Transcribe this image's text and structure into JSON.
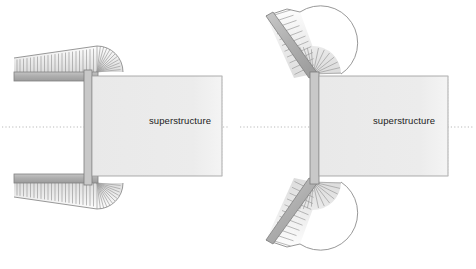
{
  "figure": {
    "background_color": "#ffffff",
    "width": 476,
    "height": 269
  },
  "palette": {
    "superstructure_fill": "#ececec",
    "superstructure_stroke": "#9a9a9a",
    "deck_band_fill": "#b0b0b0",
    "deck_band_stroke": "#808080",
    "wing_fill": "#e8e8e8",
    "wing_stroke": "#8c8c8c",
    "hatch_stroke": "#9c9c9c",
    "wall_fill": "#c8c8c8",
    "wall_stroke": "#7d7d7d",
    "centerline_color": "#b9b9b9",
    "fade_edge_color": "#cccccc",
    "text_color": "#1b1b1b"
  },
  "diagrams": [
    {
      "id": "straight-wingwall-abutment",
      "name": "Straight wingwall abutment",
      "side": "left",
      "wing_type": "straight",
      "superstructure_label": "superstructure",
      "label_position": {
        "x": 180,
        "y": 124
      },
      "centerline": {
        "y": 127,
        "x_start": 2,
        "x_end": 228
      },
      "superstructure_box": {
        "x": 92,
        "y": 76,
        "width": 130,
        "height": 100
      },
      "back_wall": {
        "x": 84,
        "y": 70,
        "width": 8,
        "height": 112
      },
      "upper_wing": {
        "band": {
          "x1": 14,
          "y1": 72,
          "x2": 96,
          "y2": 72,
          "thickness": 9
        },
        "slope_apex": {
          "x": 14,
          "y": 58
        },
        "fan_center": {
          "x": 97,
          "y": 72
        },
        "fan_radius": 26,
        "hatch_count": 26
      },
      "lower_wing": {
        "band": {
          "x1": 14,
          "y1": 183,
          "x2": 96,
          "y2": 183,
          "thickness": 9
        },
        "slope_apex": {
          "x": 14,
          "y": 197
        },
        "fan_center": {
          "x": 97,
          "y": 183
        },
        "fan_radius": 26,
        "hatch_count": 26
      }
    },
    {
      "id": "splayed-wingwall-abutment",
      "name": "Splayed wingwall abutment",
      "side": "right",
      "wing_type": "splayed",
      "superstructure_label": "superstructure",
      "label_position": {
        "x": 404,
        "y": 124
      },
      "centerline": {
        "y": 127,
        "x_start": 240,
        "x_end": 474
      },
      "superstructure_box": {
        "x": 320,
        "y": 76,
        "width": 128,
        "height": 100
      },
      "back_wall": {
        "x": 310,
        "y": 72,
        "width": 8,
        "height": 108
      },
      "upper_wing": {
        "band_start": {
          "x": 268,
          "y": 18
        },
        "band_end": {
          "x": 312,
          "y": 74
        },
        "angle_deg": 45,
        "fan_center": {
          "x": 313,
          "y": 74
        },
        "fan_radius": 28,
        "hatch_count": 24
      },
      "lower_wing": {
        "band_start": {
          "x": 268,
          "y": 238
        },
        "band_end": {
          "x": 312,
          "y": 182
        },
        "angle_deg": 45,
        "fan_center": {
          "x": 313,
          "y": 182
        },
        "fan_radius": 28,
        "hatch_count": 24
      }
    }
  ],
  "annotations": {
    "icon_names": [
      "centerline-icon",
      "hatch-pattern-icon",
      "wingwall-icon",
      "fan-slope-icon"
    ]
  }
}
